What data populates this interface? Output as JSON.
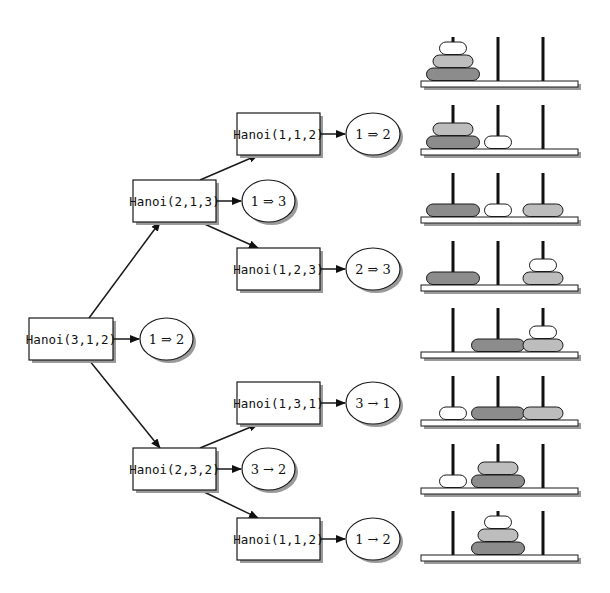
{
  "colors": {
    "stroke": "#1a1a1a",
    "shadow": "#9a9a9a",
    "box_fill": "#ffffff",
    "disc_large": "#8c8c8c",
    "disc_medium": "#bdbdbd",
    "disc_small": "#ffffff",
    "base_fill": "#ffffff",
    "peg": "#111111"
  },
  "tree": {
    "nodes": [
      {
        "id": "n0",
        "label": "Hanoi(3,1,2)",
        "move": "1 ⇒ 2",
        "x": 29,
        "y": 318,
        "w": 84,
        "h": 42,
        "ex": 140,
        "ew": 53
      },
      {
        "id": "n1",
        "label": "Hanoi(2,1,3)",
        "move": "1 ⇒ 3",
        "x": 133,
        "y": 180,
        "w": 83,
        "h": 42,
        "ex": 242,
        "ew": 53
      },
      {
        "id": "n2",
        "label": "Hanoi(2,3,2)",
        "move": "3 → 2",
        "x": 133,
        "y": 448,
        "w": 83,
        "h": 42,
        "ex": 242,
        "ew": 53
      },
      {
        "id": "n11",
        "label": "Hanoi(1,1,2)",
        "move": "1 ⇒ 2",
        "x": 237,
        "y": 113,
        "w": 83,
        "h": 42,
        "ex": 346,
        "ew": 54
      },
      {
        "id": "n12",
        "label": "Hanoi(1,2,3)",
        "move": "2 ⇒ 3",
        "x": 237,
        "y": 248,
        "w": 83,
        "h": 42,
        "ex": 346,
        "ew": 54
      },
      {
        "id": "n21",
        "label": "Hanoi(1,3,1)",
        "move": "3 → 1",
        "x": 237,
        "y": 382,
        "w": 83,
        "h": 42,
        "ex": 346,
        "ew": 54
      },
      {
        "id": "n22",
        "label": "Hanoi(1,1,2)",
        "move": "1 → 2",
        "x": 237,
        "y": 518,
        "w": 83,
        "h": 42,
        "ex": 346,
        "ew": 54
      }
    ],
    "edges": [
      {
        "from": [
          89,
          318
        ],
        "to": [
          160,
          222
        ]
      },
      {
        "from": [
          89,
          360
        ],
        "to": [
          160,
          448
        ]
      },
      {
        "from": [
          200,
          180
        ],
        "to": [
          258,
          155
        ]
      },
      {
        "from": [
          200,
          222
        ],
        "to": [
          258,
          248
        ]
      },
      {
        "from": [
          200,
          448
        ],
        "to": [
          258,
          424
        ]
      },
      {
        "from": [
          200,
          490
        ],
        "to": [
          258,
          518
        ]
      }
    ]
  },
  "towers": {
    "pegs_x": [
      453,
      498,
      543
    ],
    "base_x": 421,
    "base_w": 157,
    "base_h": 6,
    "peg_h": 44,
    "disc_h": 13,
    "disc_widths": {
      "small": 27,
      "medium": 40,
      "large": 53
    },
    "states": [
      {
        "base_y": 81,
        "pegs": [
          [
            "large",
            "medium",
            "small"
          ],
          [],
          []
        ]
      },
      {
        "base_y": 149,
        "pegs": [
          [
            "large",
            "medium"
          ],
          [
            "small"
          ],
          []
        ]
      },
      {
        "base_y": 217,
        "pegs": [
          [
            "large"
          ],
          [
            "small"
          ],
          [
            "medium"
          ]
        ]
      },
      {
        "base_y": 285,
        "pegs": [
          [
            "large"
          ],
          [],
          [
            "medium",
            "small"
          ]
        ]
      },
      {
        "base_y": 352,
        "pegs": [
          [],
          [
            "large"
          ],
          [
            "medium",
            "small"
          ]
        ]
      },
      {
        "base_y": 420,
        "pegs": [
          [
            "small"
          ],
          [
            "large"
          ],
          [
            "medium"
          ]
        ]
      },
      {
        "base_y": 488,
        "pegs": [
          [
            "small"
          ],
          [
            "large",
            "medium"
          ],
          []
        ]
      },
      {
        "base_y": 555,
        "pegs": [
          [],
          [
            "large",
            "medium",
            "small"
          ],
          []
        ]
      }
    ]
  }
}
